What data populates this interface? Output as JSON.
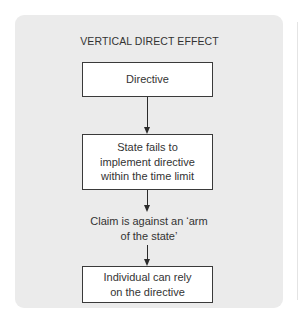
{
  "diagram": {
    "title": "VERTICAL DIRECT EFFECT",
    "steps": [
      {
        "type": "box",
        "text": "Directive"
      },
      {
        "type": "box",
        "text": "State fails to implement directive within the time limit"
      },
      {
        "type": "text",
        "text": "Claim is against an ‘arm of the state’"
      },
      {
        "type": "box",
        "text": "Individual can rely on the directive"
      }
    ],
    "colors": {
      "panel_background": "#ebebeb",
      "box_background": "#ffffff",
      "border": "#3a3a3a"
    }
  }
}
